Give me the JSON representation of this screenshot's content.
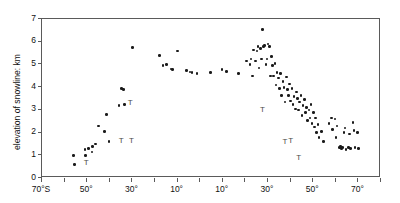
{
  "chart_data": {
    "type": "scatter",
    "title": "",
    "subtitle": "",
    "xlabel": "",
    "ylabel": "elevation of snowline: km",
    "xlim": [
      -70,
      80
    ],
    "ylim": [
      0,
      7
    ],
    "grid": false,
    "legend": null,
    "x_axis_note": "latitude, degrees; negative = South (°S), positive = North (°N)",
    "xticks": [
      -70,
      -60,
      -50,
      -40,
      -30,
      -20,
      -10,
      0,
      10,
      20,
      30,
      40,
      50,
      60,
      70,
      80
    ],
    "xticklabels": [
      "70°S",
      "60°",
      "50°",
      "40°",
      "30°",
      "20°",
      "10°",
      "0°",
      "10°",
      "20°",
      "30°",
      "40°",
      "50°",
      "60°",
      "70°",
      "80°N"
    ],
    "yticks": [
      0,
      1,
      2,
      3,
      4,
      5,
      6,
      7
    ],
    "yticklabels": [
      "0",
      "1",
      "2",
      "3",
      "4",
      "5",
      "6",
      "7"
    ],
    "marker": "filled-circle",
    "marker_color": "#1a1a1a",
    "points": [
      [
        -55.5,
        0.95
      ],
      [
        -55.2,
        0.55
      ],
      [
        -50.5,
        1.2
      ],
      [
        -50.2,
        0.95
      ],
      [
        -49.0,
        1.25
      ],
      [
        -47.5,
        1.1
      ],
      [
        -47.2,
        1.35
      ],
      [
        -46.0,
        1.45
      ],
      [
        -44.5,
        2.25
      ],
      [
        -42.0,
        2.0
      ],
      [
        -41.0,
        2.75
      ],
      [
        -40.0,
        1.55
      ],
      [
        -35.5,
        3.15
      ],
      [
        -34.5,
        3.9
      ],
      [
        -33.5,
        3.85
      ],
      [
        -33.0,
        3.2
      ],
      [
        -29.5,
        5.7
      ],
      [
        -17.5,
        5.35
      ],
      [
        -16.0,
        4.9
      ],
      [
        -14.5,
        4.95
      ],
      [
        -12.5,
        4.75
      ],
      [
        -11.8,
        4.72
      ],
      [
        -9.5,
        5.55
      ],
      [
        -5.5,
        4.7
      ],
      [
        -4.0,
        4.62
      ],
      [
        -3.2,
        4.6
      ],
      [
        -1.0,
        4.55
      ],
      [
        5.0,
        4.6
      ],
      [
        10.0,
        4.72
      ],
      [
        12.0,
        4.65
      ],
      [
        17.5,
        4.55
      ],
      [
        21.0,
        5.1
      ],
      [
        22.5,
        4.95
      ],
      [
        23.0,
        5.2
      ],
      [
        23.5,
        4.45
      ],
      [
        24.0,
        5.6
      ],
      [
        25.0,
        5.1
      ],
      [
        25.5,
        5.55
      ],
      [
        26.0,
        5.75
      ],
      [
        26.5,
        4.8
      ],
      [
        27.0,
        5.65
      ],
      [
        27.5,
        5.2
      ],
      [
        28.0,
        6.5
      ],
      [
        28.5,
        5.75
      ],
      [
        29.0,
        5.8
      ],
      [
        29.5,
        4.95
      ],
      [
        30.0,
        5.2
      ],
      [
        30.5,
        5.85
      ],
      [
        31.0,
        5.75
      ],
      [
        31.5,
        4.45
      ],
      [
        32.0,
        5.3
      ],
      [
        32.5,
        4.9
      ],
      [
        33.0,
        4.45
      ],
      [
        33.5,
        5.0
      ],
      [
        34.0,
        4.05
      ],
      [
        34.5,
        4.6
      ],
      [
        35.0,
        4.35
      ],
      [
        35.5,
        3.9
      ],
      [
        36.0,
        4.55
      ],
      [
        36.5,
        3.6
      ],
      [
        37.0,
        4.2
      ],
      [
        37.5,
        3.95
      ],
      [
        38.0,
        3.3
      ],
      [
        38.5,
        4.4
      ],
      [
        39.0,
        3.85
      ],
      [
        39.5,
        3.6
      ],
      [
        40.0,
        4.1
      ],
      [
        40.5,
        3.35
      ],
      [
        41.0,
        3.9
      ],
      [
        41.5,
        3.2
      ],
      [
        42.0,
        3.55
      ],
      [
        42.5,
        3.0
      ],
      [
        43.0,
        3.75
      ],
      [
        43.5,
        3.45
      ],
      [
        44.0,
        2.95
      ],
      [
        44.5,
        3.3
      ],
      [
        45.0,
        3.6
      ],
      [
        45.5,
        2.7
      ],
      [
        46.0,
        3.15
      ],
      [
        46.5,
        3.4
      ],
      [
        47.0,
        2.85
      ],
      [
        47.5,
        3.05
      ],
      [
        48.0,
        2.5
      ],
      [
        48.5,
        2.95
      ],
      [
        49.0,
        2.6
      ],
      [
        49.5,
        3.2
      ],
      [
        50.0,
        2.35
      ],
      [
        50.5,
        2.85
      ],
      [
        51.0,
        2.2
      ],
      [
        51.5,
        2.6
      ],
      [
        52.0,
        1.95
      ],
      [
        52.5,
        2.3
      ],
      [
        53.0,
        1.75
      ],
      [
        54.0,
        2.0
      ],
      [
        55.0,
        1.55
      ],
      [
        57.5,
        2.35
      ],
      [
        58.5,
        2.6
      ],
      [
        59.0,
        2.1
      ],
      [
        60.0,
        2.55
      ],
      [
        60.5,
        1.75
      ],
      [
        61.0,
        2.25
      ],
      [
        62.0,
        1.3
      ],
      [
        62.5,
        1.35
      ],
      [
        63.0,
        1.25
      ],
      [
        63.5,
        1.3
      ],
      [
        64.0,
        1.95
      ],
      [
        64.5,
        2.15
      ],
      [
        65.0,
        1.2
      ],
      [
        66.0,
        1.3
      ],
      [
        66.5,
        1.9
      ],
      [
        67.0,
        1.25
      ],
      [
        68.0,
        2.4
      ],
      [
        68.5,
        2.05
      ],
      [
        69.0,
        1.3
      ],
      [
        70.0,
        1.95
      ],
      [
        70.5,
        1.25
      ]
    ],
    "tee_marker": {
      "symbol": "T",
      "description": "downward arrow / tee symbols marking limiting values",
      "color": "#4a4a4a",
      "points": [
        [
          -50.0,
          0.6
        ],
        [
          -30.5,
          3.25
        ],
        [
          -34.5,
          1.6
        ],
        [
          -30.0,
          1.6
        ],
        [
          28.0,
          2.95
        ],
        [
          38.0,
          1.55
        ],
        [
          40.5,
          1.6
        ],
        [
          44.0,
          0.85
        ]
      ]
    }
  },
  "axes": {
    "tick_color": "#5a5a5a",
    "frame_color": "#5a5a5a",
    "background": "#ffffff"
  }
}
